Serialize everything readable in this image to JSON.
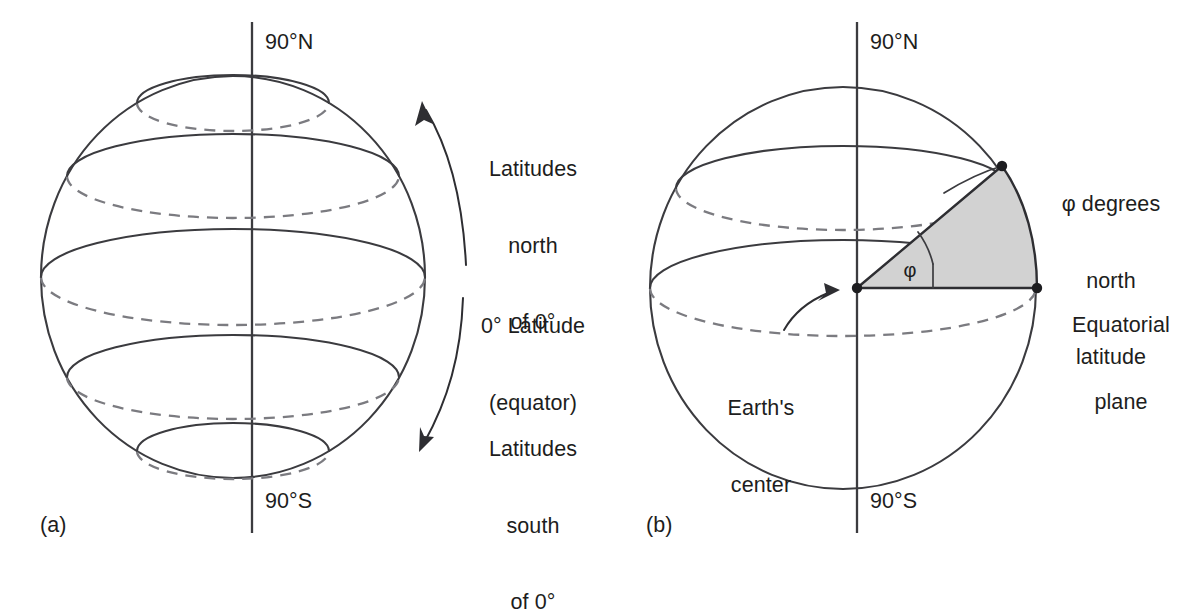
{
  "figure": {
    "type": "diagram",
    "background_color": "#ffffff",
    "line_color": "#3b3b3f",
    "dashed_line_color": "#7b7b80",
    "wedge_fill_color": "#d2d2d2",
    "dot_color": "#1d1d20",
    "text_color": "#1d1d20"
  },
  "panels": [
    {
      "tag": "(a)",
      "title_top": "90°N",
      "title_bottom": "90°S",
      "labels": {
        "north_latitudes": "Latitudes\nnorth\nof 0°",
        "equator": "0° Latitude\n(equator)",
        "south_latitudes": "Latitudes\nsouth\nof 0°"
      },
      "latitude_circles_deg": [
        60,
        30,
        0,
        -30,
        -60
      ],
      "axis_label_north": "90°N",
      "axis_label_south": "90°S"
    },
    {
      "tag": "(b)",
      "title_top": "90°N",
      "title_bottom": "90°S",
      "labels": {
        "phi_latitude": "φ degrees\nnorth\nlatitude",
        "equatorial_plane": "Equatorial\nplane",
        "earths_center": "Earth's\ncenter",
        "angle_symbol": "φ"
      },
      "latitude_circles_deg": [
        30,
        0
      ],
      "wedge_angle_symbol": "φ",
      "axis_label_north": "90°N",
      "axis_label_south": "90°S"
    }
  ],
  "text": {
    "panel_a_tag": "(a)",
    "panel_a_north_pole": "90°N",
    "panel_a_south_pole": "90°S",
    "panel_a_lat_north_l1": "Latitudes",
    "panel_a_lat_north_l2": "north",
    "panel_a_lat_north_l3": "of 0°",
    "panel_a_equator_l1": "0° Latitude",
    "panel_a_equator_l2": "(equator)",
    "panel_a_lat_south_l1": "Latitudes",
    "panel_a_lat_south_l2": "south",
    "panel_a_lat_south_l3": "of 0°",
    "panel_b_tag": "(b)",
    "panel_b_north_pole": "90°N",
    "panel_b_south_pole": "90°S",
    "panel_b_phi_l1": "φ degrees",
    "panel_b_phi_l2": "north",
    "panel_b_phi_l3": "latitude",
    "panel_b_eqplane_l1": "Equatorial",
    "panel_b_eqplane_l2": "plane",
    "panel_b_center_l1": "Earth's",
    "panel_b_center_l2": "center",
    "panel_b_angle": "φ"
  }
}
